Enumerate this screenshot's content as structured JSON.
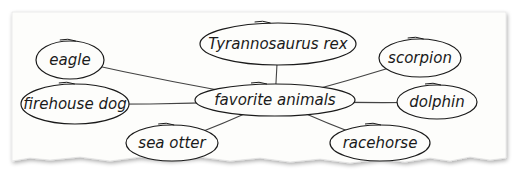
{
  "diagram": {
    "type": "concept-web",
    "center": {
      "id": "center",
      "label": "favorite animals",
      "x": 275,
      "y": 100,
      "rx": 80,
      "ry": 16
    },
    "nodes": [
      {
        "id": "trex",
        "label": "Tyrannosaurus rex",
        "x": 278,
        "y": 44,
        "rx": 78,
        "ry": 21
      },
      {
        "id": "eagle",
        "label": "eagle",
        "x": 70,
        "y": 60,
        "rx": 34,
        "ry": 19
      },
      {
        "id": "scorpion",
        "label": "scorpion",
        "x": 420,
        "y": 58,
        "rx": 41,
        "ry": 19
      },
      {
        "id": "firehouse",
        "label": "firehouse dog",
        "x": 75,
        "y": 104,
        "rx": 54,
        "ry": 20
      },
      {
        "id": "dolphin",
        "label": "dolphin",
        "x": 437,
        "y": 102,
        "rx": 40,
        "ry": 17
      },
      {
        "id": "seaotter",
        "label": "sea otter",
        "x": 172,
        "y": 143,
        "rx": 46,
        "ry": 18
      },
      {
        "id": "racehorse",
        "label": "racehorse",
        "x": 380,
        "y": 143,
        "rx": 50,
        "ry": 18
      }
    ],
    "edges": [
      {
        "from": "center",
        "to": "trex"
      },
      {
        "from": "center",
        "to": "eagle"
      },
      {
        "from": "center",
        "to": "scorpion"
      },
      {
        "from": "center",
        "to": "firehouse"
      },
      {
        "from": "center",
        "to": "dolphin"
      },
      {
        "from": "center",
        "to": "seaotter"
      },
      {
        "from": "center",
        "to": "racehorse"
      }
    ]
  },
  "colors": {
    "ink": "#1a1a1a",
    "paper": "#fdfdfb",
    "line": "#555555",
    "shadow": "#c8c8c8"
  }
}
